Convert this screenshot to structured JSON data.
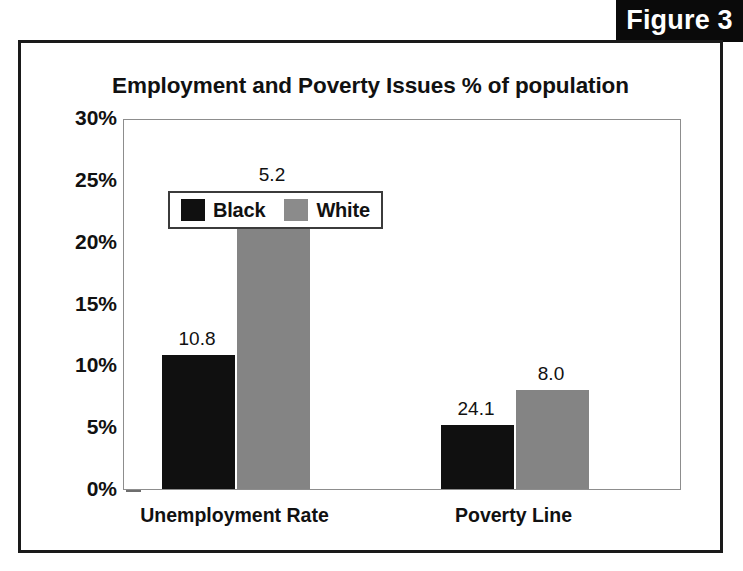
{
  "figure": {
    "tag_label": "Figure 3"
  },
  "chart_data": {
    "type": "bar",
    "title": "Employment and Poverty Issues % of population",
    "xlabel": "",
    "ylabel": "",
    "categories": [
      "Unemployment Rate",
      "Poverty Line"
    ],
    "series": [
      {
        "name": "Black",
        "color": "#101010",
        "values": [
          10.8,
          5.2
        ]
      },
      {
        "name": "White",
        "color": "#848484",
        "values": [
          24.1,
          8.0
        ]
      }
    ],
    "value_labels": [
      [
        "10.8",
        "5.2"
      ],
      [
        "24.1",
        "8.0"
      ]
    ],
    "ylim": [
      0,
      30
    ],
    "ytick_values": [
      30,
      25,
      20,
      15,
      10,
      5,
      0
    ],
    "ytick_labels": [
      "30%",
      "25%",
      "20%",
      "15%",
      "10%",
      "5%",
      "0%"
    ],
    "grid": false,
    "legend_position": "inside-top-left",
    "legend_entries": [
      "Black",
      "White"
    ]
  }
}
